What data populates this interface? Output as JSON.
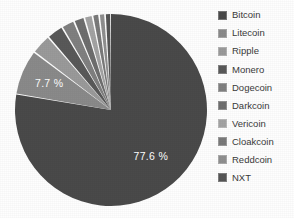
{
  "chart_data": {
    "type": "pie",
    "title": "",
    "labels": [
      "Bitcoin",
      "Litecoin",
      "Ripple",
      "Monero",
      "Dogecoin",
      "Darkcoin",
      "Vericoin",
      "Cloakcoin",
      "Reddcoin",
      "NXT"
    ],
    "values": [
      77.6,
      7.7,
      3.4,
      2.8,
      2.2,
      1.8,
      1.4,
      1.1,
      1.0,
      1.0
    ],
    "value_labels": [
      "77.6 %",
      "7.7 %",
      "",
      "",
      "",
      "",
      "",
      "",
      "",
      ""
    ],
    "visible_value_labels": [
      {
        "slice": "Bitcoin",
        "text": "77.6 %"
      },
      {
        "slice": "Litecoin",
        "text": "7.7 %"
      }
    ],
    "colors": [
      "#4a4a4a",
      "#8a8a8a",
      "#9a9a9a",
      "#595959",
      "#808080",
      "#6e6e6e",
      "#a3a3a3",
      "#7a7a7a",
      "#8f8f8f",
      "#555555"
    ],
    "start_angle_deg": 0,
    "direction": "clockwise",
    "legend_position": "right",
    "grid": false,
    "background": "#ffffff",
    "label_color": "#ffffff",
    "separator_color": "#ffffff"
  },
  "legend": {
    "items": [
      {
        "label": "Bitcoin",
        "color": "#4a4a4a"
      },
      {
        "label": "Litecoin",
        "color": "#8a8a8a"
      },
      {
        "label": "Ripple",
        "color": "#9a9a9a"
      },
      {
        "label": "Monero",
        "color": "#595959"
      },
      {
        "label": "Dogecoin",
        "color": "#808080"
      },
      {
        "label": "Darkcoin",
        "color": "#6e6e6e"
      },
      {
        "label": "Vericoin",
        "color": "#a3a3a3"
      },
      {
        "label": "Cloakcoin",
        "color": "#7a7a7a"
      },
      {
        "label": "Reddcoin",
        "color": "#8f8f8f"
      },
      {
        "label": "NXT",
        "color": "#555555"
      }
    ]
  }
}
